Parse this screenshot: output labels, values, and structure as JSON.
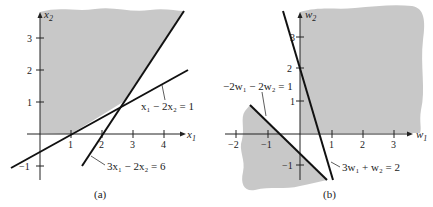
{
  "colors": {
    "shade": "#c8c8c8",
    "ink": "#111111",
    "background": "#ffffff"
  },
  "panel_a": {
    "caption": "(a)",
    "x_axis_label": "x",
    "x_axis_sub": "1",
    "y_axis_label": "x",
    "y_axis_sub": "2",
    "x_ticks": [
      "1",
      "2",
      "3",
      "4"
    ],
    "y_ticks": [
      "3",
      "2",
      "1",
      "−1"
    ],
    "line1": {
      "equation": "x₁ − 2x₂ = 1"
    },
    "line2": {
      "equation": "3x₁ − 2x₂ = 6"
    }
  },
  "panel_b": {
    "caption": "(b)",
    "x_axis_label": "w",
    "x_axis_sub": "1",
    "y_axis_label": "w",
    "y_axis_sub": "2",
    "x_ticks": [
      "−2",
      "−1",
      "1",
      "2",
      "3"
    ],
    "y_ticks": [
      "3",
      "2",
      "1",
      "−1"
    ],
    "line1": {
      "equation": "−2w₁ − 2w₂ = 1"
    },
    "line2": {
      "equation": "3w₁ + w₂ = 2"
    }
  }
}
